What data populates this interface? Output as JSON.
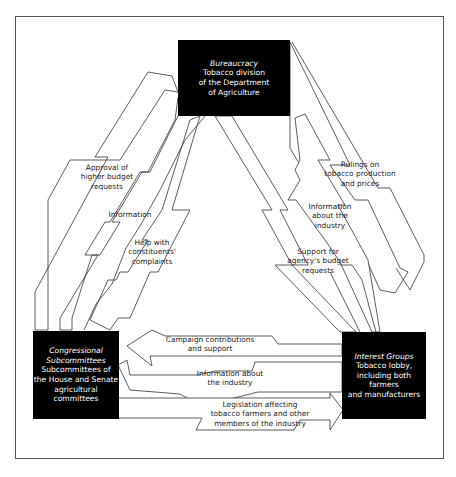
{
  "nodes": {
    "bureaucracy": {
      "title": "Bureaucracy",
      "lines": [
        "Tobacco division",
        "of the Department",
        "of Agriculture"
      ]
    },
    "congress": {
      "title": "Congressional",
      "lines": [
        "Subcommittees",
        "Subcommittees of",
        "the House and Senate",
        "agricultural",
        "committees"
      ]
    },
    "interest_groups": {
      "title": "Interest Groups",
      "lines": [
        "Tobacco lobby,",
        "including both farmers",
        "and manufacturers"
      ]
    }
  },
  "flows": {
    "approval": {
      "from": "congress",
      "to": "bureaucracy",
      "lines": [
        "Approval of",
        "higher budget",
        "requests"
      ]
    },
    "information_c_to_b": {
      "from": "congress",
      "to": "bureaucracy",
      "lines": [
        "Information"
      ]
    },
    "help": {
      "from": "bureaucracy",
      "to": "congress",
      "lines": [
        "Help with",
        "constituents'",
        "complaints"
      ]
    },
    "rulings": {
      "from": "bureaucracy",
      "to": "interest_groups",
      "lines": [
        "Rulings on",
        "tobacco production",
        "and prices"
      ]
    },
    "info_industry_i_to_b": {
      "from": "interest_groups",
      "to": "bureaucracy",
      "lines": [
        "Information",
        "about the",
        "industry"
      ]
    },
    "support": {
      "from": "interest_groups",
      "to": "bureaucracy",
      "lines": [
        "Support for",
        "agency's budget",
        "requests"
      ]
    },
    "campaign": {
      "from": "interest_groups",
      "to": "congress",
      "lines": [
        "Campaign contributions",
        "and support"
      ]
    },
    "info_industry_i_to_c": {
      "from": "interest_groups",
      "to": "congress",
      "lines": [
        "Information about",
        "the industry"
      ]
    },
    "legislation": {
      "from": "congress",
      "to": "interest_groups",
      "lines": [
        "Legislation affecting",
        "tobacco farmers and other",
        "members of the industry"
      ]
    }
  },
  "colors": {
    "node_fill": "#000000",
    "node_text": "#ffffff",
    "arrow_stroke": "#333333",
    "frame": "#555555"
  }
}
